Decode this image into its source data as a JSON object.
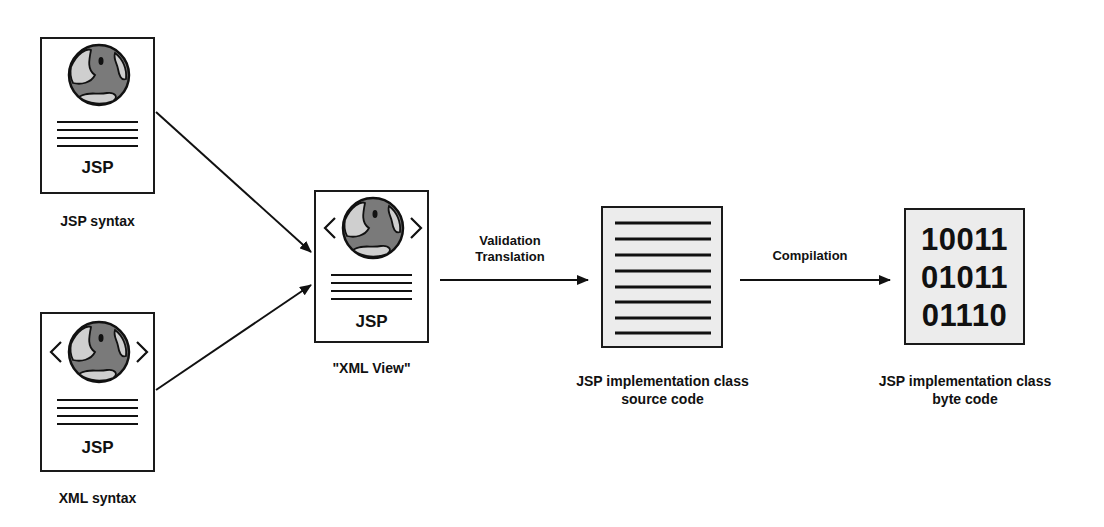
{
  "nodes": {
    "jsp_syntax": {
      "icon_text": "JSP",
      "caption": "JSP syntax"
    },
    "xml_syntax": {
      "icon_text": "JSP",
      "caption": "XML syntax"
    },
    "xml_view": {
      "icon_text": "JSP",
      "caption": "\"XML View\""
    },
    "source_code": {
      "caption_line1": "JSP implementation class",
      "caption_line2": "source code"
    },
    "byte_code": {
      "lines": [
        "10011",
        "01011",
        "01110"
      ],
      "caption_line1": "JSP implementation class",
      "caption_line2": "byte code"
    }
  },
  "edges": {
    "validation": {
      "line1": "Validation",
      "line2": "Translation"
    },
    "compilation": {
      "label": "Compilation"
    }
  },
  "colors": {
    "stroke": "#1a1a1a",
    "globe_dark": "#7a7a7a",
    "globe_light": "#cfcfcf",
    "doc_gray": "#ececec"
  }
}
